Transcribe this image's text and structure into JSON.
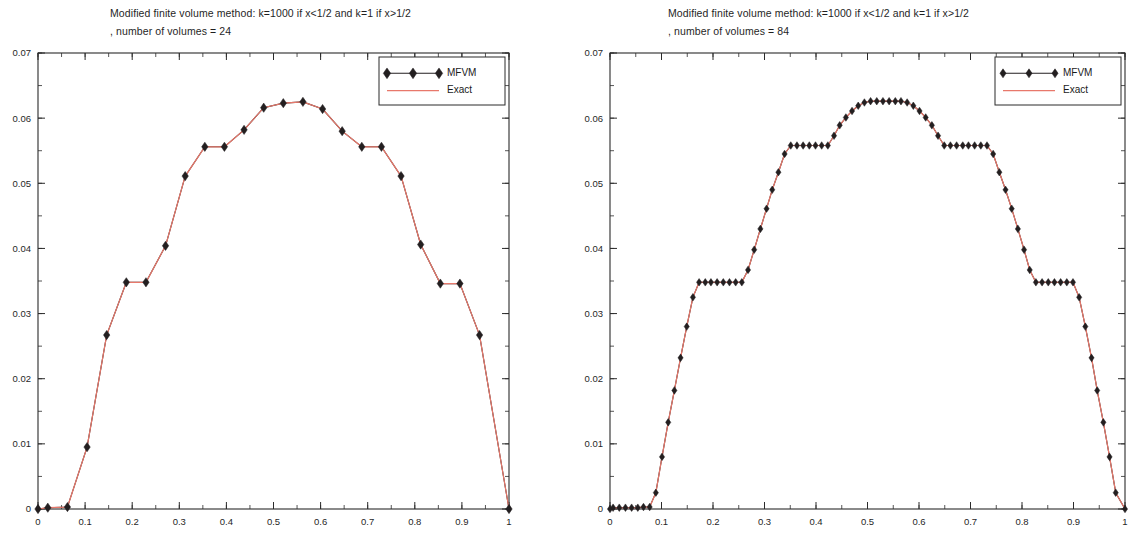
{
  "charts": [
    {
      "id": "left",
      "title_line1": "Modified finite volume method: k=1000 if x<1/2 and k=1 if x>1/2",
      "title_line2": ", number of volumes = 24",
      "legend": {
        "mfvm": "MFVM",
        "exact": "Exact"
      },
      "colors": {
        "mfvm": "#231f20",
        "exact": "#e8786b",
        "axis": "#2b2b2b"
      },
      "chart_data": {
        "type": "line",
        "title": "Modified finite volume method: k=1000 if x<1/2 and k=1 if x>1/2 , number of volumes = 24",
        "xlabel": "",
        "ylabel": "",
        "xlim": [
          0,
          1
        ],
        "ylim": [
          0,
          0.07
        ],
        "xticks": [
          0,
          0.1,
          0.2,
          0.3,
          0.4,
          0.5,
          0.6,
          0.7,
          0.8,
          0.9,
          1
        ],
        "xticklabels": [
          "0",
          "0.1",
          "0.2",
          "0.3",
          "0.4",
          "0.5",
          "0.6",
          "0.7",
          "0.8",
          "0.9",
          "1"
        ],
        "yticks": [
          0,
          0.01,
          0.02,
          0.03,
          0.04,
          0.05,
          0.06,
          0.07
        ],
        "yticklabels": [
          "0",
          "0.01",
          "0.02",
          "0.03",
          "0.04",
          "0.05",
          "0.06",
          "0.07"
        ],
        "xminor_step": 0.05,
        "yminor_step": 0.005,
        "grid": false,
        "legend_position": "top-right",
        "series": [
          {
            "name": "MFVM",
            "marker": "diamond",
            "x": [
              0.0,
              0.0208,
              0.0625,
              0.1042,
              0.1458,
              0.1875,
              0.2292,
              0.2708,
              0.3125,
              0.3542,
              0.3958,
              0.4375,
              0.4792,
              0.5208,
              0.5625,
              0.6042,
              0.6458,
              0.6875,
              0.7292,
              0.7708,
              0.8125,
              0.8542,
              0.8958,
              0.9375,
              1.0
            ],
            "y": [
              0.0,
              0.0002,
              0.0003,
              0.0095,
              0.0267,
              0.0348,
              0.0348,
              0.0404,
              0.0511,
              0.0556,
              0.0556,
              0.0582,
              0.0616,
              0.0623,
              0.0625,
              0.0614,
              0.058,
              0.0556,
              0.0556,
              0.0511,
              0.0406,
              0.0346,
              0.0346,
              0.0267,
              0.0
            ]
          },
          {
            "name": "Exact",
            "marker": "none",
            "x": [
              0.0,
              0.0208,
              0.0625,
              0.1042,
              0.1458,
              0.1875,
              0.2292,
              0.2708,
              0.3125,
              0.3542,
              0.3958,
              0.4375,
              0.4792,
              0.5208,
              0.5625,
              0.6042,
              0.6458,
              0.6875,
              0.7292,
              0.7708,
              0.8125,
              0.8542,
              0.8958,
              0.9375,
              1.0
            ],
            "y": [
              0.0,
              0.0002,
              0.0003,
              0.0095,
              0.0267,
              0.0348,
              0.0348,
              0.0404,
              0.0511,
              0.0556,
              0.0556,
              0.0582,
              0.0616,
              0.0623,
              0.0625,
              0.0614,
              0.058,
              0.0556,
              0.0556,
              0.0511,
              0.0406,
              0.0346,
              0.0346,
              0.0267,
              0.0
            ]
          }
        ]
      }
    },
    {
      "id": "right",
      "title_line1": "Modified finite volume method: k=1000 if x<1/2 and k=1 if x>1/2",
      "title_line2": ", number of volumes = 84",
      "legend": {
        "mfvm": "MFVM",
        "exact": "Exact"
      },
      "colors": {
        "mfvm": "#231f20",
        "exact": "#e8786b",
        "axis": "#2b2b2b"
      },
      "chart_data": {
        "type": "line",
        "title": "Modified finite volume method: k=1000 if x<1/2 and k=1 if x>1/2 , number of volumes = 84",
        "xlabel": "",
        "ylabel": "",
        "xlim": [
          0,
          1
        ],
        "ylim": [
          0,
          0.07
        ],
        "xticks": [
          0,
          0.1,
          0.2,
          0.3,
          0.4,
          0.5,
          0.6,
          0.7,
          0.8,
          0.9,
          1
        ],
        "xticklabels": [
          "0",
          "0.1",
          "0.2",
          "0.3",
          "0.4",
          "0.5",
          "0.6",
          "0.7",
          "0.8",
          "0.9",
          "1"
        ],
        "yticks": [
          0,
          0.01,
          0.02,
          0.03,
          0.04,
          0.05,
          0.06,
          0.07
        ],
        "yticklabels": [
          "0",
          "0.01",
          "0.02",
          "0.03",
          "0.04",
          "0.05",
          "0.06",
          "0.07"
        ],
        "xminor_step": 0.05,
        "yminor_step": 0.005,
        "grid": false,
        "legend_position": "top-right",
        "series": [
          {
            "name": "MFVM",
            "marker": "diamond",
            "x": [
              0.0,
              0.006,
              0.018,
              0.03,
              0.042,
              0.054,
              0.065,
              0.077,
              0.089,
              0.101,
              0.113,
              0.125,
              0.137,
              0.149,
              0.161,
              0.173,
              0.185,
              0.196,
              0.208,
              0.22,
              0.232,
              0.244,
              0.256,
              0.268,
              0.28,
              0.292,
              0.304,
              0.315,
              0.327,
              0.339,
              0.351,
              0.363,
              0.375,
              0.387,
              0.399,
              0.411,
              0.423,
              0.435,
              0.446,
              0.458,
              0.47,
              0.482,
              0.494,
              0.506,
              0.518,
              0.53,
              0.542,
              0.554,
              0.565,
              0.577,
              0.589,
              0.601,
              0.613,
              0.625,
              0.637,
              0.649,
              0.661,
              0.673,
              0.685,
              0.696,
              0.708,
              0.72,
              0.732,
              0.744,
              0.756,
              0.768,
              0.78,
              0.792,
              0.804,
              0.815,
              0.827,
              0.839,
              0.851,
              0.863,
              0.875,
              0.887,
              0.899,
              0.911,
              0.923,
              0.935,
              0.946,
              0.958,
              0.97,
              0.982,
              1.0
            ],
            "y": [
              0.0,
              0.0002,
              0.0002,
              0.0002,
              0.0002,
              0.0002,
              0.0003,
              0.0003,
              0.0025,
              0.008,
              0.0133,
              0.0182,
              0.0232,
              0.028,
              0.0325,
              0.0348,
              0.0348,
              0.0348,
              0.0348,
              0.0348,
              0.0348,
              0.0348,
              0.0348,
              0.0367,
              0.0398,
              0.043,
              0.0461,
              0.049,
              0.0517,
              0.0545,
              0.0558,
              0.0558,
              0.0558,
              0.0558,
              0.0558,
              0.0558,
              0.0558,
              0.0573,
              0.0589,
              0.0601,
              0.0611,
              0.0619,
              0.0624,
              0.0626,
              0.0626,
              0.0626,
              0.0626,
              0.0626,
              0.0626,
              0.0624,
              0.0619,
              0.0611,
              0.0601,
              0.0589,
              0.0573,
              0.0558,
              0.0558,
              0.0558,
              0.0558,
              0.0558,
              0.0558,
              0.0558,
              0.0558,
              0.0545,
              0.0517,
              0.049,
              0.0461,
              0.043,
              0.0398,
              0.0367,
              0.0348,
              0.0348,
              0.0348,
              0.0348,
              0.0348,
              0.0348,
              0.0348,
              0.0325,
              0.028,
              0.0232,
              0.0182,
              0.0133,
              0.008,
              0.0025,
              0.0
            ]
          },
          {
            "name": "Exact",
            "marker": "none",
            "x": [
              0.0,
              0.006,
              0.018,
              0.03,
              0.042,
              0.054,
              0.065,
              0.077,
              0.089,
              0.101,
              0.113,
              0.125,
              0.137,
              0.149,
              0.161,
              0.173,
              0.185,
              0.196,
              0.208,
              0.22,
              0.232,
              0.244,
              0.256,
              0.268,
              0.28,
              0.292,
              0.304,
              0.315,
              0.327,
              0.339,
              0.351,
              0.363,
              0.375,
              0.387,
              0.399,
              0.411,
              0.423,
              0.435,
              0.446,
              0.458,
              0.47,
              0.482,
              0.494,
              0.506,
              0.518,
              0.53,
              0.542,
              0.554,
              0.565,
              0.577,
              0.589,
              0.601,
              0.613,
              0.625,
              0.637,
              0.649,
              0.661,
              0.673,
              0.685,
              0.696,
              0.708,
              0.72,
              0.732,
              0.744,
              0.756,
              0.768,
              0.78,
              0.792,
              0.804,
              0.815,
              0.827,
              0.839,
              0.851,
              0.863,
              0.875,
              0.887,
              0.899,
              0.911,
              0.923,
              0.935,
              0.946,
              0.958,
              0.97,
              0.982,
              1.0
            ],
            "y": [
              0.0,
              0.0002,
              0.0002,
              0.0002,
              0.0002,
              0.0002,
              0.0003,
              0.0003,
              0.0025,
              0.008,
              0.0133,
              0.0182,
              0.0232,
              0.028,
              0.0325,
              0.0348,
              0.0348,
              0.0348,
              0.0348,
              0.0348,
              0.0348,
              0.0348,
              0.0348,
              0.0367,
              0.0398,
              0.043,
              0.0461,
              0.049,
              0.0517,
              0.0545,
              0.0558,
              0.0558,
              0.0558,
              0.0558,
              0.0558,
              0.0558,
              0.0558,
              0.0573,
              0.0589,
              0.0601,
              0.0611,
              0.0619,
              0.0624,
              0.0626,
              0.0626,
              0.0626,
              0.0626,
              0.0626,
              0.0626,
              0.0624,
              0.0619,
              0.0611,
              0.0601,
              0.0589,
              0.0573,
              0.0558,
              0.0558,
              0.0558,
              0.0558,
              0.0558,
              0.0558,
              0.0558,
              0.0558,
              0.0545,
              0.0517,
              0.049,
              0.0461,
              0.043,
              0.0398,
              0.0367,
              0.0348,
              0.0348,
              0.0348,
              0.0348,
              0.0348,
              0.0348,
              0.0348,
              0.0325,
              0.028,
              0.0232,
              0.0182,
              0.0133,
              0.008,
              0.0025,
              0.0
            ]
          }
        ]
      }
    }
  ]
}
